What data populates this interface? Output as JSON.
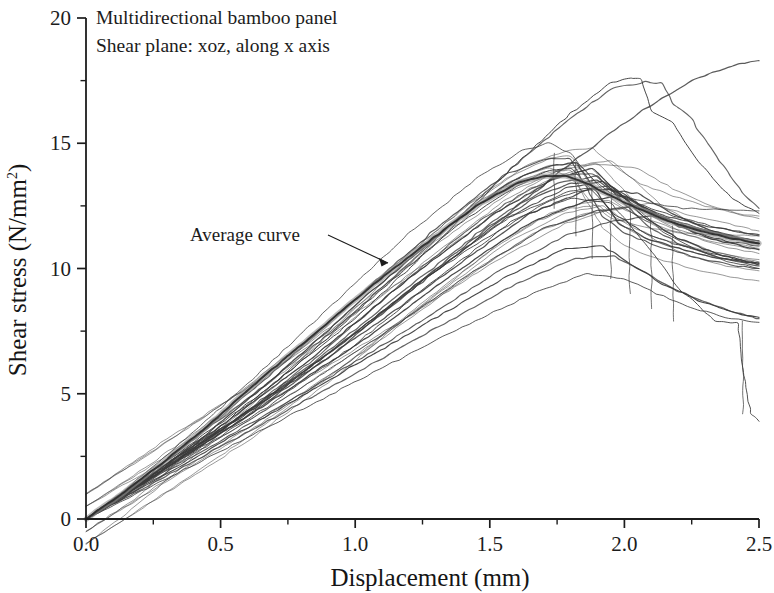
{
  "figure": {
    "background_color": "#ffffff",
    "line_color": "#3a3a3a",
    "average_curve_color": "#8f8f8f",
    "axis_color": "#1c1c1c"
  },
  "annotations": {
    "note_line1": "Multidirectional bamboo panel",
    "note_line2": "Shear plane: xoz, along x axis",
    "average_label": "Average curve"
  },
  "axes": {
    "x_title": "Displacement (mm)",
    "y_title_main": "Shear stress (N/mm",
    "y_title_sup": "2",
    "y_title_close": ")",
    "x_ticks": [
      "0.0",
      "0.5",
      "1.0",
      "1.5",
      "2.0",
      "2.5"
    ],
    "y_ticks": [
      "0",
      "5",
      "10",
      "15",
      "20"
    ]
  },
  "chart_data": {
    "type": "line",
    "xlabel": "Displacement (mm)",
    "ylabel": "Shear stress (N/mm2)",
    "xlim": [
      0.0,
      2.5
    ],
    "ylim": [
      0,
      20
    ],
    "x_major_ticks": [
      0.0,
      0.5,
      1.0,
      1.5,
      2.0,
      2.5
    ],
    "x_minor_step": 0.25,
    "y_major_ticks": [
      0,
      5,
      10,
      15,
      20
    ],
    "y_minor_step": 2.5,
    "grid": false,
    "legend": "none",
    "annotations": [
      {
        "text": "Multidirectional bamboo panel",
        "x": 0.06,
        "y": 19.4
      },
      {
        "text": "Shear plane: xoz, along x axis",
        "x": 0.06,
        "y": 18.2
      },
      {
        "text": "Average curve",
        "x": 0.41,
        "y": 11.1,
        "arrow_to_x": 1.12,
        "arrow_to_y": 10.15
      }
    ],
    "series": [
      {
        "name": "specimen-1",
        "x": [
          0.0,
          0.15,
          0.35,
          0.6,
          0.9,
          1.2,
          1.45,
          1.62,
          1.72,
          1.8,
          1.88,
          1.95,
          2.02,
          2.1,
          2.22,
          2.36,
          2.5
        ],
        "y": [
          0.0,
          1.2,
          3.0,
          5.4,
          8.4,
          11.4,
          13.6,
          14.7,
          15.0,
          14.6,
          13.6,
          13.0,
          12.8,
          12.6,
          12.4,
          12.35,
          12.3
        ]
      },
      {
        "name": "specimen-2",
        "x": [
          0.0,
          0.18,
          0.4,
          0.7,
          1.0,
          1.3,
          1.55,
          1.7,
          1.8,
          1.86,
          1.92,
          2.0,
          2.12,
          2.28,
          2.42,
          2.5
        ],
        "y": [
          0.0,
          1.3,
          3.2,
          5.9,
          8.8,
          11.6,
          13.7,
          14.35,
          14.4,
          13.2,
          12.1,
          11.4,
          10.9,
          10.4,
          10.1,
          10.0
        ]
      },
      {
        "name": "specimen-3",
        "x": [
          0.0,
          0.2,
          0.45,
          0.75,
          1.05,
          1.35,
          1.58,
          1.72,
          1.82,
          1.9,
          1.98,
          2.08,
          2.2,
          2.35,
          2.5
        ],
        "y": [
          0.0,
          1.4,
          3.4,
          6.1,
          9.0,
          11.7,
          13.5,
          14.1,
          14.2,
          13.0,
          11.8,
          11.2,
          10.8,
          10.4,
          10.2
        ]
      },
      {
        "name": "specimen-4",
        "x": [
          0.0,
          0.22,
          0.5,
          0.8,
          1.1,
          1.4,
          1.6,
          1.72,
          1.8,
          1.88,
          1.96,
          2.06,
          2.18,
          2.32,
          2.46,
          2.5
        ],
        "y": [
          0.0,
          1.55,
          3.7,
          6.3,
          9.2,
          11.9,
          13.3,
          13.9,
          14.0,
          13.1,
          12.2,
          11.5,
          11.0,
          10.6,
          10.3,
          10.25
        ]
      },
      {
        "name": "specimen-5",
        "x": [
          0.0,
          0.25,
          0.55,
          0.85,
          1.15,
          1.45,
          1.65,
          1.78,
          1.88,
          1.96,
          2.06,
          2.18,
          2.3,
          2.42,
          2.5
        ],
        "y": [
          0.0,
          1.7,
          3.9,
          6.4,
          9.2,
          11.8,
          13.2,
          13.7,
          13.8,
          13.1,
          12.4,
          11.9,
          11.5,
          11.2,
          11.1
        ]
      },
      {
        "name": "specimen-6",
        "x": [
          0.0,
          0.28,
          0.6,
          0.92,
          1.22,
          1.5,
          1.68,
          1.8,
          1.9,
          2.0,
          2.12,
          2.26,
          2.4,
          2.5
        ],
        "y": [
          0.0,
          1.9,
          4.1,
          6.6,
          9.3,
          11.7,
          12.9,
          13.4,
          13.5,
          12.8,
          12.2,
          11.8,
          11.5,
          11.35
        ]
      },
      {
        "name": "specimen-7",
        "x": [
          0.0,
          0.3,
          0.65,
          0.98,
          1.28,
          1.55,
          1.72,
          1.84,
          1.94,
          2.05,
          2.18,
          2.32,
          2.45,
          2.5
        ],
        "y": [
          0.0,
          2.0,
          4.3,
          6.8,
          9.4,
          11.6,
          12.7,
          13.1,
          13.2,
          12.6,
          12.1,
          11.7,
          11.4,
          11.3
        ]
      },
      {
        "name": "specimen-8",
        "x": [
          0.0,
          0.2,
          0.5,
          0.85,
          1.2,
          1.52,
          1.74,
          1.88,
          1.98,
          2.08,
          2.2,
          2.34,
          2.48,
          2.5
        ],
        "y": [
          0.0,
          1.45,
          3.7,
          6.5,
          9.6,
          12.2,
          13.6,
          14.0,
          13.0,
          12.0,
          11.2,
          10.6,
          10.2,
          10.15
        ]
      },
      {
        "name": "specimen-9",
        "x": [
          0.0,
          0.24,
          0.55,
          0.9,
          1.25,
          1.55,
          1.75,
          1.9,
          2.0,
          2.1,
          2.22,
          2.36,
          2.5
        ],
        "y": [
          0.0,
          1.6,
          3.9,
          6.7,
          9.7,
          12.2,
          13.4,
          13.7,
          12.6,
          11.6,
          10.9,
          10.4,
          10.1
        ]
      },
      {
        "name": "specimen-10",
        "x": [
          0.0,
          0.3,
          0.62,
          0.95,
          1.28,
          1.58,
          1.8,
          1.95,
          2.05,
          2.14,
          2.26,
          2.38,
          2.5
        ],
        "y": [
          0.0,
          2.1,
          4.4,
          7.0,
          9.8,
          12.1,
          13.1,
          13.3,
          12.4,
          11.5,
          10.8,
          10.3,
          10.0
        ]
      },
      {
        "name": "specimen-11",
        "x": [
          0.0,
          0.26,
          0.58,
          0.92,
          1.26,
          1.56,
          1.78,
          1.92,
          2.02,
          2.12,
          2.24,
          2.38,
          2.5
        ],
        "y": [
          0.0,
          1.8,
          4.1,
          6.8,
          9.6,
          12.0,
          13.2,
          13.5,
          12.8,
          12.1,
          11.5,
          11.1,
          10.9
        ]
      },
      {
        "name": "specimen-12",
        "x": [
          0.0,
          0.35,
          0.7,
          1.05,
          1.38,
          1.66,
          1.86,
          2.0,
          2.1,
          2.2,
          2.32,
          2.44,
          2.5
        ],
        "y": [
          0.0,
          2.4,
          4.8,
          7.3,
          9.9,
          11.9,
          12.7,
          12.9,
          12.3,
          11.7,
          11.2,
          10.9,
          10.75
        ]
      },
      {
        "name": "specimen-13",
        "x": [
          0.0,
          0.4,
          0.78,
          1.12,
          1.44,
          1.7,
          1.9,
          2.04,
          2.16,
          2.28,
          2.4,
          2.5
        ],
        "y": [
          0.0,
          2.6,
          5.1,
          7.5,
          9.9,
          11.6,
          12.3,
          12.5,
          12.0,
          11.6,
          11.3,
          11.1
        ]
      },
      {
        "name": "specimen-14",
        "x": [
          0.0,
          0.45,
          0.85,
          1.2,
          1.52,
          1.78,
          1.96,
          2.1,
          2.22,
          2.34,
          2.46,
          2.5
        ],
        "y": [
          0.0,
          2.8,
          5.3,
          7.6,
          9.8,
          11.3,
          11.9,
          12.1,
          11.7,
          11.4,
          11.1,
          11.0
        ]
      },
      {
        "name": "specimen-15",
        "x": [
          0.0,
          0.3,
          0.65,
          1.0,
          1.35,
          1.65,
          1.88,
          2.05,
          2.18,
          2.3,
          2.42,
          2.5
        ],
        "y": [
          0.0,
          2.2,
          4.6,
          7.2,
          9.9,
          12.2,
          13.2,
          13.0,
          12.2,
          11.6,
          11.2,
          11.0
        ]
      },
      {
        "name": "specimen-16-high",
        "x": [
          0.0,
          0.3,
          0.65,
          1.0,
          1.32,
          1.6,
          1.8,
          1.95,
          2.02,
          2.06,
          2.1,
          2.18,
          2.28,
          2.4,
          2.5
        ],
        "y": [
          0.0,
          2.3,
          5.0,
          8.0,
          11.2,
          14.2,
          16.2,
          17.4,
          17.6,
          17.55,
          16.3,
          15.8,
          14.2,
          12.8,
          12.2
        ]
      },
      {
        "name": "specimen-17-high",
        "x": [
          0.0,
          0.28,
          0.6,
          0.95,
          1.28,
          1.58,
          1.8,
          1.96,
          2.08,
          2.14,
          2.18,
          2.24,
          2.34,
          2.44,
          2.5
        ],
        "y": [
          0.0,
          2.2,
          4.8,
          7.8,
          11.0,
          14.0,
          16.0,
          17.2,
          17.45,
          17.4,
          16.6,
          16.1,
          14.5,
          13.0,
          12.4
        ]
      },
      {
        "name": "specimen-18-rising",
        "x": [
          0.0,
          0.35,
          0.75,
          1.15,
          1.5,
          1.8,
          2.05,
          2.25,
          2.4,
          2.5
        ],
        "y": [
          0.0,
          2.5,
          5.4,
          8.6,
          11.6,
          14.2,
          16.2,
          17.5,
          18.1,
          18.3
        ]
      },
      {
        "name": "specimen-19-deep-drop",
        "x": [
          0.0,
          0.25,
          0.58,
          0.95,
          1.3,
          1.6,
          1.8,
          1.95,
          2.08,
          2.2,
          2.34,
          2.42,
          2.44,
          2.47,
          2.5
        ],
        "y": [
          0.0,
          1.7,
          4.0,
          7.0,
          9.9,
          12.0,
          12.8,
          12.6,
          11.0,
          9.2,
          7.9,
          7.8,
          6.0,
          4.2,
          3.9
        ]
      },
      {
        "name": "specimen-20-low",
        "x": [
          0.0,
          0.4,
          0.8,
          1.2,
          1.55,
          1.78,
          1.92,
          2.02,
          2.14,
          2.28,
          2.42,
          2.5
        ],
        "y": [
          0.0,
          2.4,
          4.9,
          7.4,
          9.6,
          10.8,
          10.9,
          10.2,
          9.4,
          8.7,
          8.2,
          8.05
        ]
      },
      {
        "name": "specimen-21-low",
        "x": [
          0.0,
          0.45,
          0.88,
          1.28,
          1.6,
          1.82,
          1.96,
          2.08,
          2.2,
          2.34,
          2.46,
          2.5
        ],
        "y": [
          0.0,
          2.6,
          5.1,
          7.5,
          9.4,
          10.4,
          10.5,
          9.8,
          9.1,
          8.5,
          8.1,
          8.0
        ]
      },
      {
        "name": "specimen-22-lowest",
        "x": [
          0.0,
          0.5,
          0.95,
          1.35,
          1.66,
          1.86,
          2.0,
          2.12,
          2.26,
          2.4,
          2.5
        ],
        "y": [
          0.0,
          2.7,
          5.2,
          7.4,
          9.0,
          9.8,
          9.6,
          9.0,
          8.4,
          8.0,
          7.85
        ]
      }
    ],
    "average_curve": {
      "name": "Average curve",
      "x": [
        0.0,
        0.12,
        0.28,
        0.45,
        0.65,
        0.85,
        1.05,
        1.25,
        1.45,
        1.6,
        1.7,
        1.78,
        1.86,
        1.95,
        2.05,
        2.16,
        2.28,
        2.4,
        2.5
      ],
      "y": [
        0.0,
        0.9,
        2.2,
        3.7,
        5.6,
        7.4,
        9.2,
        10.9,
        12.5,
        13.4,
        13.7,
        13.7,
        13.4,
        12.9,
        12.4,
        11.9,
        11.5,
        11.2,
        11.0
      ]
    }
  }
}
